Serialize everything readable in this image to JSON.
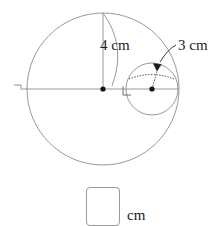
{
  "figure": {
    "type": "two-tangent-circles-diagram",
    "stroke_color": "#8d8d8d",
    "dot_color": "#111111",
    "leader_color": "#3a3a3a",
    "large_circle": {
      "name": "large-circle",
      "center_x": 103,
      "center_y": 89,
      "radius_px": 76,
      "radius_label": "4 cm",
      "radius_value": 4,
      "unit": "cm"
    },
    "small_circle": {
      "name": "small-circle",
      "center_x": 152,
      "center_y": 89,
      "radius_px": 26,
      "radius_label": "3 cm",
      "radius_value": 3,
      "unit": "cm"
    },
    "labels": {
      "radius_large": "4 cm",
      "radius_small": "3 cm"
    },
    "markers": {
      "left_tick": "right-angle-tick",
      "center_right_angle": "right-angle-mark",
      "small_center_right_angle": "right-angle-mark"
    }
  },
  "answer": {
    "value": "",
    "placeholder": "",
    "unit": "cm"
  }
}
